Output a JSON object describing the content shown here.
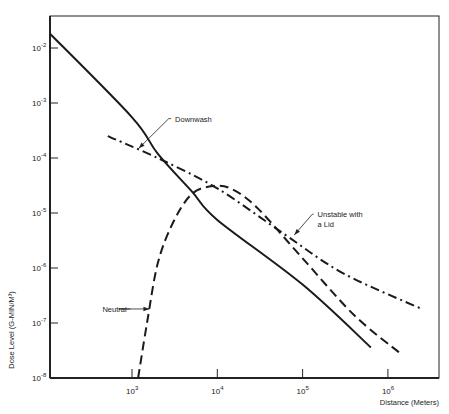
{
  "chart_data": {
    "type": "line",
    "title": "",
    "xlabel": "Distance (Meters)",
    "ylabel": "Dose Level (G-MIN/M³)",
    "xscale": "log",
    "yscale": "log",
    "xlim": [
      100,
      5000000
    ],
    "ylim": [
      1e-08,
      0.03
    ],
    "grid": false,
    "x_ticks": [
      {
        "value": 1000,
        "label": "10",
        "exp": "3"
      },
      {
        "value": 10000,
        "label": "10",
        "exp": "4"
      },
      {
        "value": 100000,
        "label": "10",
        "exp": "5"
      },
      {
        "value": 1000000,
        "label": "10",
        "exp": "6"
      }
    ],
    "y_ticks": [
      {
        "value": 0.01,
        "label": "10",
        "exp": "-2"
      },
      {
        "value": 0.001,
        "label": "10",
        "exp": "-3"
      },
      {
        "value": 0.0001,
        "label": "10",
        "exp": "-4"
      },
      {
        "value": 1e-05,
        "label": "10",
        "exp": "-5"
      },
      {
        "value": 1e-06,
        "label": "10",
        "exp": "-6"
      },
      {
        "value": 1e-07,
        "label": "10",
        "exp": "-7"
      },
      {
        "value": 1e-08,
        "label": "10",
        "exp": "-8"
      }
    ],
    "series": [
      {
        "name": "Downwash",
        "style": "solid",
        "points": [
          [
            110,
            0.018
          ],
          [
            1000,
            0.00055
          ],
          [
            2000,
            0.00012
          ],
          [
            5000,
            2.5e-05
          ],
          [
            10000,
            7.5e-06
          ],
          [
            100000,
            5e-07
          ],
          [
            630000,
            3.6e-08
          ]
        ]
      },
      {
        "name": "Unstable with a Lid",
        "style": "dash-dot",
        "points": [
          [
            520,
            0.00025
          ],
          [
            2000,
            0.0001
          ],
          [
            10000,
            2.8e-05
          ],
          [
            60000,
            4.2e-06
          ],
          [
            300000,
            8e-07
          ],
          [
            2500000,
            1.8e-07
          ]
        ]
      },
      {
        "name": "Neutral",
        "style": "dashed",
        "points": [
          [
            1180,
            1e-08
          ],
          [
            1500,
            1e-07
          ],
          [
            2000,
            1.2e-06
          ],
          [
            3000,
            6.5e-06
          ],
          [
            5000,
            2.2e-05
          ],
          [
            9000,
            3.1e-05
          ],
          [
            15000,
            2.7e-05
          ],
          [
            30000,
            1.2e-05
          ],
          [
            100000,
            1.5e-06
          ],
          [
            400000,
            1.4e-07
          ],
          [
            1400000,
            2.8e-08
          ]
        ]
      }
    ],
    "annotations": [
      {
        "text": "Downwash",
        "lines": [
          "Downwash"
        ],
        "target": [
          1200,
          0.00015
        ],
        "elbow": [
          2700,
          0.00052
        ],
        "label_at": [
          3200,
          0.00052
        ]
      },
      {
        "text": "Unstable with a Lid",
        "lines": [
          "Unstable with",
          "a Lid"
        ],
        "target": [
          80000,
          4e-06
        ],
        "elbow": [
          130000,
          9.5e-06
        ],
        "label_at": [
          150000,
          9.5e-06
        ]
      },
      {
        "text": "Neutral",
        "lines": [
          "Neutral"
        ],
        "target": [
          1600,
          1.8e-07
        ],
        "elbow": [
          700,
          1.8e-07
        ],
        "label_at": [
          450,
          1.8e-07
        ]
      }
    ],
    "legend": "none"
  }
}
